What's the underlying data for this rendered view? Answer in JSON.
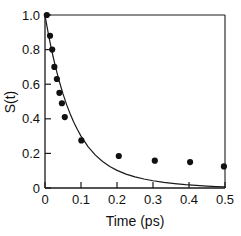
{
  "chart_data": {
    "type": "scatter",
    "title": "",
    "subtitle": "",
    "xlabel": "Time (ps)",
    "ylabel": "S(t)",
    "xlim": [
      0,
      0.5
    ],
    "ylim": [
      0,
      1.0
    ],
    "xticks": [
      0,
      0.1,
      0.2,
      0.3,
      0.4,
      0.5
    ],
    "xtick_labels": [
      "0",
      "0.1",
      "0.2",
      "0.3",
      "0.4",
      "0.5"
    ],
    "yticks": [
      0,
      0.2,
      0.4,
      0.6,
      0.8,
      1.0
    ],
    "ytick_labels": [
      "0",
      "0.2",
      "0.4",
      "0.6",
      "0.8",
      "1.0"
    ],
    "grid": false,
    "legend": null,
    "legend_position": "none",
    "series": [
      {
        "name": "data points",
        "type": "scatter",
        "marker": "filled-circle",
        "color": "#111111",
        "x": [
          0.005,
          0.014,
          0.02,
          0.026,
          0.033,
          0.04,
          0.047,
          0.055,
          0.101,
          0.205,
          0.305,
          0.403,
          0.497
        ],
        "y": [
          1.0,
          0.88,
          0.8,
          0.7,
          0.63,
          0.55,
          0.49,
          0.41,
          0.275,
          0.185,
          0.158,
          0.15,
          0.125
        ]
      },
      {
        "name": "model curve",
        "type": "line",
        "color": "#1a1a1a",
        "x": [
          0.0,
          0.005,
          0.01,
          0.015,
          0.02,
          0.025,
          0.03,
          0.04,
          0.05,
          0.06,
          0.07,
          0.08,
          0.09,
          0.1,
          0.12,
          0.14,
          0.16,
          0.18,
          0.2,
          0.225,
          0.25,
          0.275,
          0.3,
          0.33,
          0.36,
          0.39,
          0.42,
          0.45,
          0.475,
          0.5
        ],
        "y": [
          1.0,
          0.94,
          0.884,
          0.832,
          0.783,
          0.737,
          0.693,
          0.614,
          0.544,
          0.482,
          0.428,
          0.38,
          0.338,
          0.3,
          0.238,
          0.19,
          0.153,
          0.124,
          0.102,
          0.08,
          0.064,
          0.052,
          0.042,
          0.032,
          0.025,
          0.019,
          0.015,
          0.011,
          0.008,
          0.006
        ]
      }
    ]
  },
  "axes": {
    "x_title": "Time (ps)",
    "y_title": "S(t)"
  }
}
